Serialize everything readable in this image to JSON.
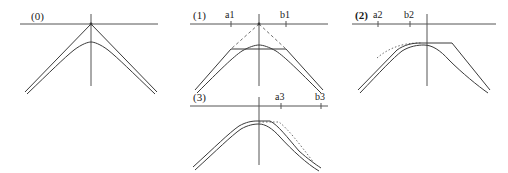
{
  "figure": {
    "background_color": "#ffffff",
    "line_color": "#3a3a3a",
    "axis_color": "#555555",
    "label_color": "#1a1a1a"
  },
  "panels": [
    {
      "id": "panel-0",
      "label": "(0)",
      "label_bold": false,
      "ticks": [],
      "has_dashed_construction": false,
      "has_dotted_overlay": false,
      "peak_type": "cusp"
    },
    {
      "id": "panel-1",
      "label": "(1)",
      "label_bold": false,
      "ticks": [
        {
          "name": "a1",
          "side": "left"
        },
        {
          "name": "b1",
          "side": "right"
        }
      ],
      "has_dashed_construction": true,
      "has_dotted_overlay": false,
      "peak_type": "rounded-chord"
    },
    {
      "id": "panel-2",
      "label": "(2)",
      "label_bold": true,
      "ticks": [
        {
          "name": "a2",
          "side": "left"
        },
        {
          "name": "b2",
          "side": "left"
        }
      ],
      "has_dashed_construction": false,
      "has_dotted_overlay": true,
      "peak_type": "plateau-shifted-right"
    },
    {
      "id": "panel-3",
      "label": "(3)",
      "label_bold": false,
      "ticks": [
        {
          "name": "a3",
          "side": "right"
        },
        {
          "name": "b3",
          "side": "right"
        }
      ],
      "has_dashed_construction": false,
      "has_dotted_overlay": true,
      "peak_type": "plateau-shifted-left"
    }
  ]
}
